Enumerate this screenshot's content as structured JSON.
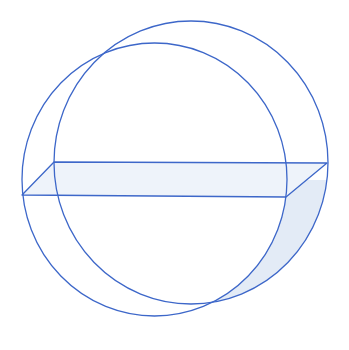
{
  "diagram": {
    "colors": {
      "stroke": "#3d67c9",
      "fill_plane": "#eef3fa",
      "fill_crescent": "#e3ebf6",
      "background": "#ffffff"
    },
    "circles": [
      {
        "name": "left-circle",
        "cx": 154.5,
        "cy": 179.5,
        "rx": 132.5,
        "ry": 136.5
      },
      {
        "name": "right-circle",
        "cx": 191,
        "cy": 162.5,
        "rx": 137,
        "ry": 141.5
      }
    ],
    "plane": {
      "points": [
        [
          54,
          162
        ],
        [
          327,
          163
        ],
        [
          286,
          197
        ],
        [
          22,
          195
        ]
      ]
    }
  }
}
